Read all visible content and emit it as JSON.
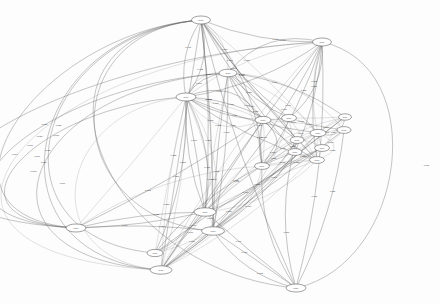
{
  "figure": {
    "kind": "directed-graph",
    "title": "",
    "background_color": "#fdfdfd",
    "edge_color": "#5a5a5a",
    "node_fill": "#ffffff",
    "node_stroke": "#444444",
    "label_color": "#333333",
    "node_count": 20,
    "edge_count": 118,
    "layout": "hierarchical-spline",
    "canvas": {
      "width": 440,
      "height": 304
    }
  },
  "chart_data": {
    "type": "graph",
    "title": "",
    "xlabel": "",
    "ylabel": "",
    "directed": true,
    "legend": [],
    "nodes": [
      {
        "id": "n1",
        "label": "node",
        "x": 201,
        "y": 20,
        "rx": 9.5,
        "ry": 4.0
      },
      {
        "id": "n2",
        "label": "node",
        "x": 322,
        "y": 42,
        "rx": 9.5,
        "ry": 4.0
      },
      {
        "id": "n3",
        "label": "node",
        "x": 228,
        "y": 73,
        "rx": 9.0,
        "ry": 3.8
      },
      {
        "id": "n4",
        "label": "node",
        "x": 186,
        "y": 97,
        "rx": 10.0,
        "ry": 4.0
      },
      {
        "id": "n5",
        "label": "node",
        "x": 263,
        "y": 120,
        "rx": 8.0,
        "ry": 3.6
      },
      {
        "id": "n6",
        "label": "node",
        "x": 289,
        "y": 118,
        "rx": 7.5,
        "ry": 3.6
      },
      {
        "id": "n7",
        "label": "node",
        "x": 318,
        "y": 133,
        "rx": 8.0,
        "ry": 3.6
      },
      {
        "id": "n8",
        "label": "node",
        "x": 297,
        "y": 140,
        "rx": 7.0,
        "ry": 3.4
      },
      {
        "id": "n9",
        "label": "node",
        "x": 322,
        "y": 148,
        "rx": 7.5,
        "ry": 3.4
      },
      {
        "id": "n10",
        "label": "node",
        "x": 295,
        "y": 152,
        "rx": 7.0,
        "ry": 3.4
      },
      {
        "id": "n11",
        "label": "node",
        "x": 317,
        "y": 160,
        "rx": 7.5,
        "ry": 3.4
      },
      {
        "id": "n12",
        "label": "node",
        "x": 262,
        "y": 166,
        "rx": 7.5,
        "ry": 3.4
      },
      {
        "id": "n13",
        "label": "node",
        "x": 344,
        "y": 130,
        "rx": 7.0,
        "ry": 3.4
      },
      {
        "id": "n14",
        "label": "node",
        "x": 205,
        "y": 212,
        "rx": 11.0,
        "ry": 4.2
      },
      {
        "id": "n15",
        "label": "node",
        "x": 213,
        "y": 231,
        "rx": 11.5,
        "ry": 4.2
      },
      {
        "id": "n16",
        "label": "node",
        "x": 76,
        "y": 228,
        "rx": 10.0,
        "ry": 4.0
      },
      {
        "id": "n17",
        "label": "node",
        "x": 155,
        "y": 253,
        "rx": 8.0,
        "ry": 3.6
      },
      {
        "id": "n18",
        "label": "node",
        "x": 161,
        "y": 270,
        "rx": 11.0,
        "ry": 4.2
      },
      {
        "id": "n19",
        "label": "node",
        "x": 296,
        "y": 288,
        "rx": 10.0,
        "ry": 4.0
      },
      {
        "id": "n20",
        "label": "node",
        "x": 345,
        "y": 117,
        "rx": 6.5,
        "ry": 3.2
      }
    ],
    "edge_weight_labels": [
      "0.081",
      "0.062",
      "0.045",
      "0.038",
      "0.031",
      "0.028",
      "0.025",
      "0.022",
      "0.019",
      "0.017",
      "0.015",
      "0.013",
      "0.012",
      "0.011",
      "0.010",
      "0.009",
      "0.008",
      "0.007",
      "0.006",
      "0.005"
    ]
  }
}
